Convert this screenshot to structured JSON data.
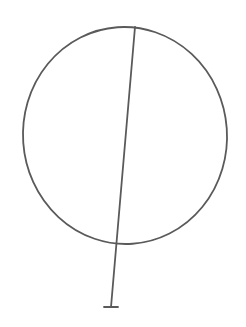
{
  "drawing": {
    "background": "#ffffff",
    "stroke_color": "#5a5a5a",
    "stroke_width": 1.8,
    "shapes": {
      "circle": {
        "cx": 125,
        "cy": 135.5,
        "rx": 102,
        "ry": 108.5,
        "rotate": -4
      },
      "stick": {
        "x1": 135,
        "y1": 27,
        "x2": 111,
        "y2": 307
      },
      "crossbar": {
        "x1": 104,
        "y1": 307,
        "x2": 118,
        "y2": 307
      }
    }
  }
}
